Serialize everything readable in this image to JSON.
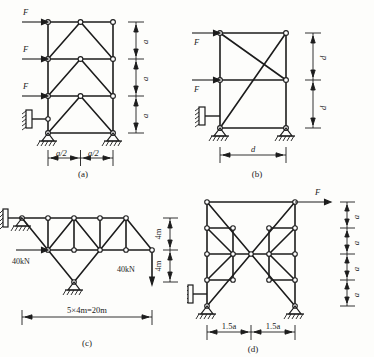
{
  "page": {
    "background": "#fdfdfb",
    "ink": "#1c1c1c"
  },
  "figures": [
    {
      "id": "a",
      "caption": "(a)",
      "description": "Three-story braced frame, pin-jointed truss-frame with triangular bracing in each story",
      "loads": [
        {
          "name": "F",
          "label": "F",
          "direction": "right",
          "story": "top"
        },
        {
          "name": "F",
          "label": "F",
          "direction": "right",
          "story": "middle"
        },
        {
          "name": "F",
          "label": "F",
          "direction": "right",
          "story": "bottom"
        }
      ],
      "vertical_dimensions": [
        "a",
        "a",
        "a"
      ],
      "horizontal_dimensions": [
        "a/2",
        "a/2"
      ],
      "supports": [
        "horizontal-link-roller",
        "pin",
        "pin"
      ]
    },
    {
      "id": "b",
      "caption": "(b)",
      "description": "Two-story frame with X-bracing in upper bay and single diagonal in lower bay",
      "loads": [
        {
          "name": "F",
          "label": "F",
          "direction": "right",
          "story": "top"
        },
        {
          "name": "F",
          "label": "F",
          "direction": "right",
          "story": "middle"
        }
      ],
      "vertical_dimensions": [
        "d",
        "d"
      ],
      "horizontal_dimensions": [
        "d"
      ],
      "supports": [
        "horizontal-link-roller",
        "pin",
        "pin"
      ]
    },
    {
      "id": "c",
      "caption": "(c)",
      "description": "Cantilever truss with five panels, horizontal and vertical 40kN loads",
      "loads": [
        {
          "name": "load-left",
          "label": "40kN",
          "direction": "right"
        },
        {
          "name": "load-right",
          "label": "40kN",
          "direction": "down"
        }
      ],
      "vertical_dimensions": [
        "4m",
        "4m"
      ],
      "horizontal_dimensions": [
        "5×4m=20m"
      ],
      "supports": [
        "horizontal-link-roller",
        "pin"
      ]
    },
    {
      "id": "d",
      "caption": "(d)",
      "description": "Four-story symmetric frame with bow-tie cross bracing, horizontal load F at top",
      "loads": [
        {
          "name": "F",
          "label": "F",
          "direction": "right",
          "story": "top"
        }
      ],
      "vertical_dimensions": [
        "a",
        "a",
        "a",
        "a"
      ],
      "horizontal_dimensions": [
        "1.5a",
        "1.5a"
      ],
      "supports": [
        "horizontal-link-roller",
        "pin",
        "pin"
      ]
    }
  ]
}
